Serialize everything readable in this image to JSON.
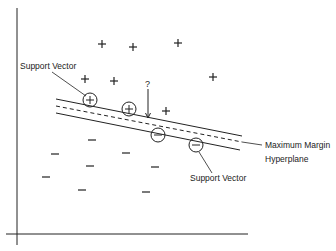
{
  "diagram": {
    "colors": {
      "ink": "#222222",
      "background": "#ffffff"
    },
    "axes": {
      "y_axis": {
        "x": 17,
        "y1": 8,
        "y2": 245
      },
      "x_axis": {
        "y": 234,
        "x1": 6,
        "x2": 248
      }
    },
    "lines": {
      "upper_margin": {
        "x1": 56,
        "y1": 99,
        "x2": 242,
        "y2": 136,
        "style": "solid"
      },
      "hyperplane": {
        "x1": 56,
        "y1": 106,
        "x2": 242,
        "y2": 142,
        "style": "dashed"
      },
      "lower_margin": {
        "x1": 56,
        "y1": 113,
        "x2": 240,
        "y2": 150,
        "style": "solid"
      }
    },
    "positive_points": [
      {
        "x": 102,
        "y": 44
      },
      {
        "x": 133,
        "y": 47
      },
      {
        "x": 178,
        "y": 43
      },
      {
        "x": 85,
        "y": 79
      },
      {
        "x": 114,
        "y": 81
      },
      {
        "x": 213,
        "y": 77
      },
      {
        "x": 166,
        "y": 111
      }
    ],
    "positive_support_vectors": [
      {
        "x": 90,
        "y": 100
      },
      {
        "x": 129,
        "y": 109
      }
    ],
    "negative_points": [
      {
        "x": 92,
        "y": 140
      },
      {
        "x": 55,
        "y": 154
      },
      {
        "x": 126,
        "y": 153
      },
      {
        "x": 90,
        "y": 166
      },
      {
        "x": 46,
        "y": 177
      },
      {
        "x": 82,
        "y": 190
      },
      {
        "x": 155,
        "y": 167
      },
      {
        "x": 146,
        "y": 192
      }
    ],
    "negative_support_vectors": [
      {
        "x": 158,
        "y": 135
      },
      {
        "x": 196,
        "y": 145
      }
    ],
    "query": {
      "symbol": "?",
      "x": 148,
      "y_top": 89,
      "y_bottom": 118
    },
    "labels": {
      "support_vector_top": "Support Vector",
      "max_margin_line1": "Maximum Margin",
      "max_margin_line2": "Hyperplane",
      "support_vector_bottom": "Support Vector",
      "query_mark": "?"
    }
  }
}
